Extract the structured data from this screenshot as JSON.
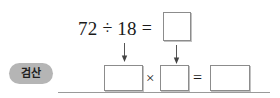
{
  "worksheet": {
    "background_color": "#ffffff",
    "width": 280,
    "height": 98
  },
  "top_equation": {
    "dividend": "72",
    "division_sign": "÷",
    "divisor": "18",
    "equals_sign": "=",
    "quotient_box": ""
  },
  "arrows": {
    "left_arrow": "down-arrow",
    "right_arrow": "down-arrow"
  },
  "label": {
    "text": "검산",
    "background_color": "#b5b5b5",
    "text_color": "#202020"
  },
  "check_equation": {
    "divisor_box": "",
    "multiply_sign": "×",
    "quotient_box": "",
    "equals_sign": "=",
    "dividend_box": ""
  },
  "rule": {
    "color": "#9a9a9a"
  },
  "box_style": {
    "border_color": "#8c8c8c",
    "fill_color": "#ffffff"
  }
}
